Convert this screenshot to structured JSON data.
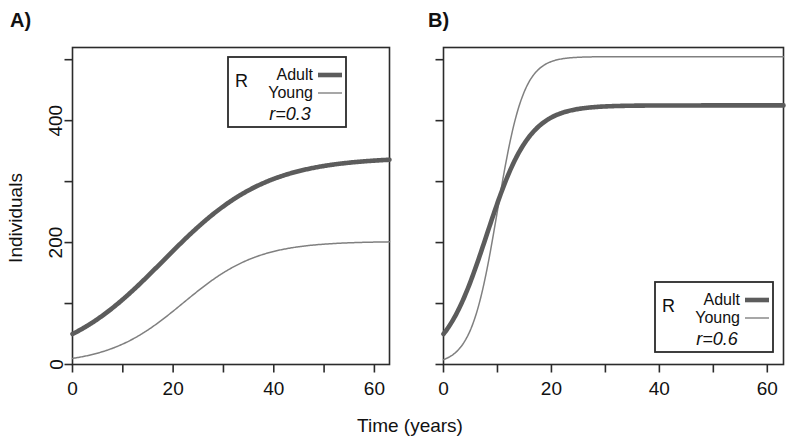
{
  "figure": {
    "xlabel": "Time (years)",
    "ylabel": "Individuals"
  },
  "panels": [
    {
      "label": "A)",
      "legend": {
        "prefix": "R",
        "adult_label": "Adult",
        "young_label": "Young",
        "rate_label": "r=0.3"
      }
    },
    {
      "label": "B)",
      "legend": {
        "prefix": "R",
        "adult_label": "Adult",
        "young_label": "Young",
        "rate_label": "r=0.6"
      }
    }
  ],
  "axis": {
    "x_ticks_major": [
      0,
      20,
      40,
      60
    ],
    "x_ticks_minor": [
      10,
      30,
      50
    ],
    "x_tick_labels": [
      "0",
      "20",
      "40",
      "60"
    ],
    "y_ticks_major": [
      0,
      200,
      400
    ],
    "y_ticks_minor": [
      100,
      300,
      500
    ],
    "y_tick_labels": [
      "0",
      "200",
      "400"
    ],
    "xlim": [
      0,
      63
    ],
    "ylim": [
      0,
      520
    ]
  },
  "chart_data": {
    "type": "line",
    "title": "",
    "xlabel": "Time (years)",
    "ylabel": "Individuals",
    "xlim": [
      0,
      63
    ],
    "ylim": [
      0,
      520
    ],
    "grid": false,
    "legend_position": "panel A: top-center inside; panel B: bottom-right inside",
    "panels": [
      {
        "panel": "A",
        "annotation": "r=0.3",
        "growth_rate": 0.3,
        "series": [
          {
            "name": "Adult",
            "style": "thick",
            "initial": 50,
            "carrying_capacity": 340,
            "inflection_year": 18,
            "x": [
              0,
              5,
              10,
              15,
              20,
              25,
              30,
              35,
              40,
              45,
              50,
              55,
              60
            ],
            "values": [
              50,
              62,
              92,
              140,
              203,
              262,
              301,
              322,
              332,
              336,
              338,
              339,
              340
            ]
          },
          {
            "name": "Young",
            "style": "thin",
            "initial": 10,
            "carrying_capacity": 202,
            "inflection_year": 22,
            "x": [
              0,
              5,
              10,
              15,
              20,
              25,
              30,
              35,
              40,
              45,
              50,
              55,
              60
            ],
            "values": [
              10,
              26,
              50,
              80,
              115,
              148,
              173,
              189,
              196,
              200,
              201,
              202,
              202
            ]
          }
        ]
      },
      {
        "panel": "B",
        "annotation": "r=0.6",
        "growth_rate": 0.6,
        "series": [
          {
            "name": "Adult",
            "style": "thick",
            "initial": 50,
            "carrying_capacity": 425,
            "inflection_year": 8,
            "x": [
              0,
              2,
              4,
              6,
              8,
              10,
              12,
              14,
              16,
              20,
              30,
              40,
              50,
              60
            ],
            "values": [
              50,
              58,
              85,
              140,
              228,
              320,
              385,
              412,
              421,
              424,
              425,
              425,
              425,
              425
            ]
          },
          {
            "name": "Young",
            "style": "thin",
            "initial": 8,
            "carrying_capacity": 505,
            "inflection_year": 10,
            "x": [
              0,
              2,
              4,
              6,
              8,
              10,
              12,
              14,
              16,
              20,
              30,
              40,
              50,
              60
            ],
            "values": [
              8,
              22,
              55,
              120,
              225,
              350,
              440,
              485,
              499,
              504,
              505,
              505,
              505,
              505
            ]
          }
        ]
      }
    ]
  }
}
